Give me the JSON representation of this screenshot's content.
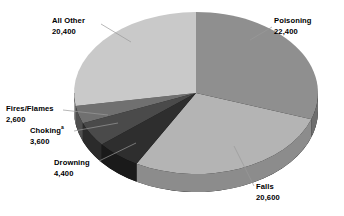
{
  "chart_data": {
    "type": "pie",
    "title": "",
    "subtitle": "",
    "xlabel": "",
    "ylabel": "",
    "legend_position": "none",
    "grid": false,
    "style": "3d-pie-grayscale",
    "total": 74000,
    "start_angle_deg": 0,
    "direction": "clockwise",
    "categories": [
      "Poisoning",
      "Falls",
      "Drowning",
      "Choking",
      "Fires/Flames",
      "All Other"
    ],
    "values": [
      22400,
      20600,
      4400,
      3600,
      2600,
      20400
    ],
    "value_labels": [
      "22,400",
      "20,600",
      "4,400",
      "3,600",
      "2,600",
      "20,400"
    ],
    "slices": [
      {
        "name": "Poisoning",
        "label": "Poisoning",
        "value": 22400,
        "value_label": "22,400",
        "color": "#8f8f8f",
        "side_color": "#6e6e6e",
        "footnote_marker": ""
      },
      {
        "name": "Falls",
        "label": "Falls",
        "value": 20600,
        "value_label": "20,600",
        "color": "#b4b4b4",
        "side_color": "#8c8c8c",
        "footnote_marker": ""
      },
      {
        "name": "Drowning",
        "label": "Drowning",
        "value": 4400,
        "value_label": "4,400",
        "color": "#2e2e2e",
        "side_color": "#1a1a1a",
        "footnote_marker": ""
      },
      {
        "name": "Choking",
        "label": "Choking",
        "value": 3600,
        "value_label": "3,600",
        "color": "#4a4a4a",
        "side_color": "#2b2b2b",
        "footnote_marker": "a"
      },
      {
        "name": "Fires/Flames",
        "label": "Fires/Flames",
        "value": 2600,
        "value_label": "2,600",
        "color": "#707070",
        "side_color": "#4f4f4f",
        "footnote_marker": ""
      },
      {
        "name": "All Other",
        "label": "All Other",
        "value": 20400,
        "value_label": "20,400",
        "color": "#c9c9c9",
        "side_color": "#a0a0a0",
        "footnote_marker": ""
      }
    ],
    "colors": {
      "background": "#ffffff",
      "text": "#000000",
      "base_3d": "#000000",
      "leader_line": "#9a9a9a"
    }
  }
}
